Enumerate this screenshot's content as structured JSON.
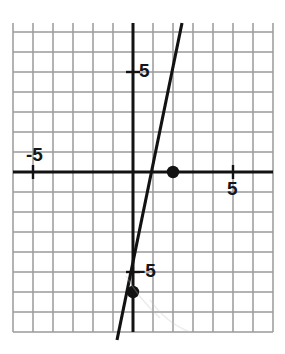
{
  "chart_data": {
    "type": "line",
    "title": "",
    "xlabel": "",
    "ylabel": "",
    "grid": true,
    "legend": null,
    "xlim": [
      -6,
      7
    ],
    "ylim": [
      -8,
      7.45
    ],
    "x_tick_labels": [
      {
        "value": -5,
        "text": "-5"
      },
      {
        "value": 5,
        "text": "5"
      }
    ],
    "y_tick_labels": [
      {
        "value": 5,
        "text": "5"
      },
      {
        "value": -5,
        "text": "-5"
      }
    ],
    "gridline_step": 1,
    "series": [
      {
        "name": "line",
        "slope": 3,
        "intercept": -6,
        "equation": "y = 3x - 6",
        "x": [
          -0.8,
          2.45
        ],
        "y": [
          -8.4,
          7.45
        ]
      }
    ],
    "points": [
      {
        "x": 2,
        "y": 0,
        "label": "x-intercept"
      },
      {
        "x": 0,
        "y": -6,
        "label": "y-intercept"
      }
    ],
    "colors": {
      "grid": "#9a9a9a",
      "axis": "#121212",
      "line": "#121212",
      "point": "#121212",
      "label": "#161616",
      "background": "#ffffff"
    }
  },
  "labels": {
    "y_positive_five": "5",
    "x_negative_five": "-5",
    "x_positive_five": "5",
    "y_negative_five": "-5"
  }
}
